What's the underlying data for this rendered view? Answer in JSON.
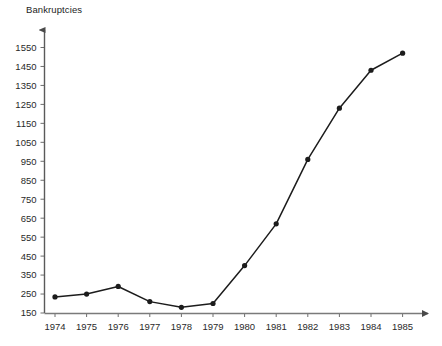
{
  "chart_data": {
    "type": "line",
    "title": "",
    "ylabel": "Bankruptcies",
    "xlabel": "",
    "categories": [
      1974,
      1975,
      1976,
      1977,
      1978,
      1979,
      1980,
      1981,
      1982,
      1983,
      1984,
      1985
    ],
    "values": [
      235,
      250,
      290,
      210,
      180,
      200,
      400,
      620,
      960,
      1230,
      1430,
      1520
    ],
    "x_tick_labels": [
      "1974",
      "1975",
      "1976",
      "1977",
      "1978",
      "1979",
      "1980",
      "1981",
      "1982",
      "1983",
      "1984",
      "1985"
    ],
    "y_tick_labels": [
      "150",
      "250",
      "350",
      "450",
      "550",
      "650",
      "750",
      "850",
      "950",
      "1050",
      "1150",
      "1250",
      "1350",
      "1450",
      "1550"
    ],
    "y_tick_values": [
      150,
      250,
      350,
      450,
      550,
      650,
      750,
      850,
      950,
      1050,
      1150,
      1250,
      1350,
      1450,
      1550
    ],
    "ylim": [
      150,
      1590
    ],
    "xlim": [
      1973.6,
      1986.2
    ],
    "grid": false,
    "legend": false,
    "legend_position": "none",
    "marker": "circle",
    "line_color": "#1c1c1c",
    "marker_color": "#1c1c1c",
    "axis_color": "#555555",
    "text_color": "#2a2a2a",
    "axis_arrows": true
  }
}
